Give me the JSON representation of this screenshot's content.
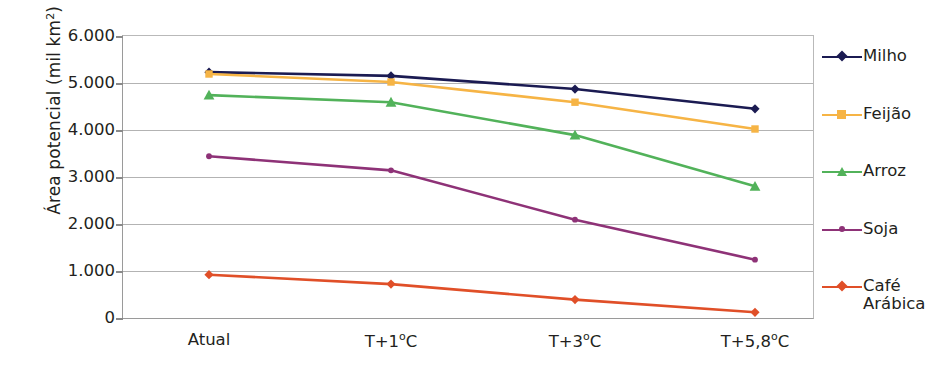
{
  "chart_data": {
    "type": "line",
    "title": "",
    "xlabel": "",
    "ylabel": "Área potencial (mil km²)",
    "categories": [
      "Atual",
      "T+1ºC",
      "T+3ºC",
      "T+5,8ºC"
    ],
    "ylim": [
      0,
      6000
    ],
    "ytick_values": [
      6000,
      5000,
      4000,
      3000,
      2000,
      1000,
      0
    ],
    "ytick_labels": [
      "6.000",
      "5.000",
      "4.000",
      "3.000",
      "2.000",
      "1.000",
      "0"
    ],
    "grid": true,
    "legend_position": "right",
    "series": [
      {
        "name": "Milho",
        "values": [
          5210,
          5130,
          4850,
          4430
        ],
        "color": "#1b1b52",
        "marker": "diamond"
      },
      {
        "name": "Feijão",
        "values": [
          5170,
          5000,
          4570,
          4000
        ],
        "color": "#f6b445",
        "marker": "square"
      },
      {
        "name": "Arroz",
        "values": [
          4720,
          4570,
          3870,
          2780
        ],
        "color": "#52b25a",
        "marker": "triangle"
      },
      {
        "name": "Soja",
        "values": [
          3420,
          3120,
          2070,
          1220
        ],
        "color": "#8e3277",
        "marker": "circle"
      },
      {
        "name": "Café Arábica",
        "values": [
          900,
          700,
          370,
          100
        ],
        "color": "#e04f28",
        "marker": "diamond"
      }
    ]
  },
  "axis": {
    "y_title_main": "Área potencial (mil km",
    "y_title_sup": "2",
    "y_title_end": ")"
  },
  "legend": {
    "items": [
      {
        "label": "Milho"
      },
      {
        "label": "Feijão"
      },
      {
        "label": "Arroz"
      },
      {
        "label": "Soja"
      },
      {
        "label": "Café\nArábica"
      }
    ]
  },
  "colors": {
    "milho": "#1b1b52",
    "feijao": "#f6b445",
    "arroz": "#52b25a",
    "soja": "#8e3277",
    "cafe": "#e04f28",
    "grid": "#b3b3b3",
    "axis": "#9a9a9a",
    "text": "#231f20",
    "background": "#ffffff"
  }
}
